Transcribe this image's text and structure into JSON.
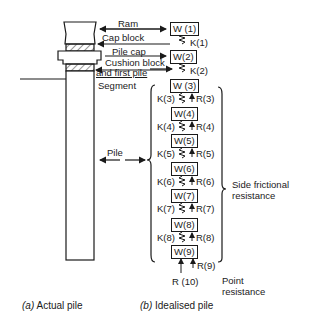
{
  "diagram": {
    "left": {
      "labels": {
        "ram": "Ram",
        "cap_block": "Cap block",
        "pile_cap": "Pile cap",
        "cushion_block": "Cushion block",
        "and_first_pile": "and first pile",
        "segment": "Segment",
        "pile": "Pile"
      },
      "caption_prefix": "(a)",
      "caption": "Actual pile"
    },
    "right": {
      "weights": [
        "W (1)",
        "W(2)",
        "W (3)",
        "W(4)",
        "W(5)",
        "W(6)",
        "W(7)",
        "W(8)",
        "W(9)"
      ],
      "springs": [
        "K(1)",
        "K(2)",
        "K(3)",
        "K(4)",
        "K(5)",
        "K(6)",
        "K(7)",
        "K(8)"
      ],
      "resistances": [
        "R(3)",
        "R(4)",
        "R(5)",
        "R(6)",
        "R(7)",
        "R(8)",
        "R(9)"
      ],
      "point_resistance_label": "R (10)",
      "side_frictional_1": "Side frictional",
      "side_frictional_2": "resistance",
      "point_1": "Point",
      "point_2": "resistance",
      "caption_prefix": "(b)",
      "caption": "Idealised pile"
    }
  }
}
